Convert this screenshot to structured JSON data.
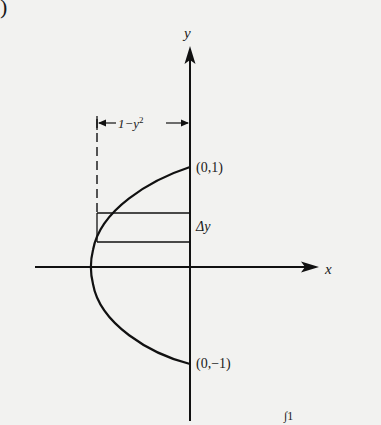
{
  "figure": {
    "corner_label": ")",
    "axes": {
      "x_label": "x",
      "y_label": "y"
    },
    "points": {
      "top": "(0,1)",
      "bottom": "(0,−1)"
    },
    "strip_label": "Δy",
    "width_label": {
      "base": "1−y",
      "exponent": "2"
    },
    "curve": "x = y^2 - 1",
    "partial_bottom_text": "∫1"
  }
}
